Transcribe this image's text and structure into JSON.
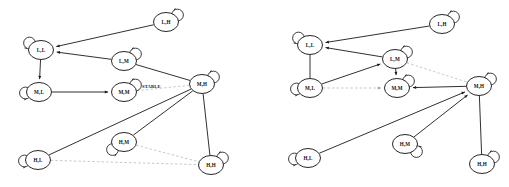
{
  "figure": {
    "background_color": "#ffffff",
    "node_fill": "#ffffff",
    "edge_color": "#1a1a1a",
    "dashed_edge_color": "#b9b9b9",
    "label_color": "#111111"
  },
  "panels": [
    {
      "id": "left",
      "name": "left-state-diagram",
      "annotations": [
        {
          "text": "STABLE",
          "x": 142,
          "y": 86
        }
      ],
      "nodes": [
        {
          "id": "LL",
          "label": "L,L",
          "x": 41,
          "y": 50,
          "rx": 12.5,
          "ry": 9.5,
          "loop": "upper-left"
        },
        {
          "id": "LH",
          "label": "L,H",
          "x": 166,
          "y": 22,
          "rx": 12.5,
          "ry": 9.5,
          "loop": "upper-right"
        },
        {
          "id": "LM",
          "label": "L,M",
          "x": 124,
          "y": 61,
          "rx": 12.5,
          "ry": 9.5,
          "loop": "upper-right"
        },
        {
          "id": "ML",
          "label": "M,L",
          "x": 39,
          "y": 92,
          "rx": 12.5,
          "ry": 9.5,
          "loop": "left"
        },
        {
          "id": "MM",
          "label": "M,M",
          "x": 124,
          "y": 92,
          "rx": 12.5,
          "ry": 9.5,
          "loop": "upper-right"
        },
        {
          "id": "MH",
          "label": "M,H",
          "x": 202,
          "y": 84,
          "rx": 12.5,
          "ry": 9.5,
          "loop": "upper-right"
        },
        {
          "id": "HL",
          "label": "H,L",
          "x": 38,
          "y": 160,
          "rx": 12.5,
          "ry": 9.5,
          "loop": "left"
        },
        {
          "id": "HM",
          "label": "H,M",
          "x": 124,
          "y": 142,
          "rx": 12.5,
          "ry": 9.5,
          "loop": "lower-left"
        },
        {
          "id": "HH",
          "label": "H,H",
          "x": 211,
          "y": 165,
          "rx": 12.5,
          "ry": 9.5,
          "loop": "upper-right"
        }
      ],
      "edges": [
        {
          "from": "LH",
          "to": "LL",
          "style": "solid",
          "arrow": "end"
        },
        {
          "from": "LM",
          "to": "LL",
          "style": "solid",
          "arrow": "end"
        },
        {
          "from": "LL",
          "to": "ML",
          "style": "solid",
          "arrow": "end"
        },
        {
          "from": "ML",
          "to": "MM",
          "style": "solid",
          "arrow": "end"
        },
        {
          "from": "LM",
          "to": "MH",
          "style": "solid",
          "arrow": "none"
        },
        {
          "from": "MM",
          "to": "MH",
          "style": "dashed",
          "arrow": "none"
        },
        {
          "from": "MH",
          "to": "HL",
          "style": "solid",
          "arrow": "none"
        },
        {
          "from": "MH",
          "to": "HM",
          "style": "solid",
          "arrow": "none"
        },
        {
          "from": "MH",
          "to": "HH",
          "style": "solid",
          "arrow": "none"
        },
        {
          "from": "HM",
          "to": "HH",
          "style": "dashed",
          "arrow": "none"
        },
        {
          "from": "HL",
          "to": "HH",
          "style": "dashed",
          "arrow": "none"
        }
      ]
    },
    {
      "id": "right",
      "name": "right-state-diagram",
      "annotations": [],
      "nodes": [
        {
          "id": "LL",
          "label": "L,L",
          "x": 56,
          "y": 45,
          "rx": 12.5,
          "ry": 9.5,
          "loop": "upper-left"
        },
        {
          "id": "LH",
          "label": "L,H",
          "x": 188,
          "y": 24,
          "rx": 12.5,
          "ry": 9.5,
          "loop": "upper-right"
        },
        {
          "id": "LM",
          "label": "L,M",
          "x": 141,
          "y": 59,
          "rx": 12.5,
          "ry": 9.5,
          "loop": "upper-right"
        },
        {
          "id": "ML",
          "label": "M,L",
          "x": 56,
          "y": 88,
          "rx": 12.5,
          "ry": 9.5,
          "loop": "left"
        },
        {
          "id": "MM",
          "label": "M,M",
          "x": 143,
          "y": 88,
          "rx": 12.5,
          "ry": 9.5,
          "loop": "upper-right"
        },
        {
          "id": "MH",
          "label": "M,H",
          "x": 225,
          "y": 86,
          "rx": 12.5,
          "ry": 9.5,
          "loop": "upper-right"
        },
        {
          "id": "HL",
          "label": "H,L",
          "x": 54,
          "y": 158,
          "rx": 12.5,
          "ry": 9.5,
          "loop": "left"
        },
        {
          "id": "HM",
          "label": "H,M",
          "x": 151,
          "y": 144,
          "rx": 12.5,
          "ry": 9.5,
          "loop": "lower-right"
        },
        {
          "id": "HH",
          "label": "H,H",
          "x": 228,
          "y": 164,
          "rx": 12.5,
          "ry": 9.5,
          "loop": "upper-right"
        }
      ],
      "edges": [
        {
          "from": "LH",
          "to": "LL",
          "style": "solid",
          "arrow": "end"
        },
        {
          "from": "LM",
          "to": "LL",
          "style": "solid",
          "arrow": "end"
        },
        {
          "from": "LL",
          "to": "ML",
          "style": "solid",
          "arrow": "none"
        },
        {
          "from": "ML",
          "to": "LM",
          "style": "solid",
          "arrow": "end"
        },
        {
          "from": "LM",
          "to": "MM",
          "style": "solid",
          "arrow": "end"
        },
        {
          "from": "ML",
          "to": "MM",
          "style": "dashed",
          "arrow": "end"
        },
        {
          "from": "LM",
          "to": "MH",
          "style": "dashed",
          "arrow": "none"
        },
        {
          "from": "MH",
          "to": "MM",
          "style": "solid",
          "arrow": "end"
        },
        {
          "from": "HL",
          "to": "MH",
          "style": "solid",
          "arrow": "end"
        },
        {
          "from": "HM",
          "to": "MH",
          "style": "solid",
          "arrow": "end"
        },
        {
          "from": "MH",
          "to": "HH",
          "style": "solid",
          "arrow": "none"
        }
      ]
    }
  ]
}
